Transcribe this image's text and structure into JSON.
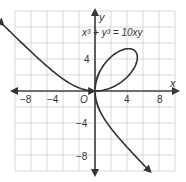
{
  "chart_data": {
    "type": "line",
    "title": "",
    "equation": "x³ + y³ = 10xy",
    "xlabel": "x",
    "ylabel": "y",
    "origin_label": "O",
    "xlim": [
      -10,
      10
    ],
    "ylim": [
      -10,
      10
    ],
    "grid": true,
    "grid_step": 2,
    "x_ticks": [
      "−8",
      "−4",
      "4",
      "8"
    ],
    "y_ticks": [
      "4",
      "−4",
      "−8"
    ],
    "series": [
      {
        "name": "Folium of Descartes",
        "equation": "x^3 + y^3 = 10xy",
        "a": 10
      }
    ]
  },
  "labels": {
    "x_axis": "x",
    "y_axis": "y",
    "origin": "O",
    "equation": "x³ + y³ = 10xy",
    "tick_xm8": "−8",
    "tick_xm4": "−4",
    "tick_x4": "4",
    "tick_x8": "8",
    "tick_y4": "4",
    "tick_ym4": "−4",
    "tick_ym8": "−8"
  },
  "colors": {
    "curve": "#333333",
    "grid": "#cccccc",
    "axis": "#444444"
  }
}
